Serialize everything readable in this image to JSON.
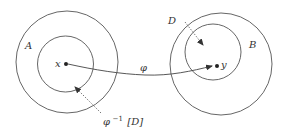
{
  "diagram": {
    "colors": {
      "stroke": "#555555",
      "text": "#333333",
      "background": "#ffffff"
    },
    "sets": [
      {
        "id": "A",
        "label": "A",
        "outer": {
          "cx": 67,
          "cy": 62,
          "r": 51
        },
        "inner": {
          "cx": 65.5,
          "cy": 64,
          "r": 28
        }
      },
      {
        "id": "B",
        "label": "B",
        "outer": {
          "cx": 221,
          "cy": 64,
          "r": 51
        },
        "inner": {
          "cx": 213,
          "cy": 52,
          "r": 28
        }
      }
    ],
    "points": {
      "x": {
        "label": "x",
        "cx": 66,
        "cy": 64
      },
      "y": {
        "label": "y",
        "cx": 217,
        "cy": 66
      }
    },
    "mapping": {
      "label": "φ",
      "style": "solid-arrow"
    },
    "subset_labels": {
      "D": {
        "label": "D",
        "style": "dotted-arrow"
      },
      "preimage": {
        "symbol": "φ",
        "superscript": "−1",
        "bracket_text": "[D]",
        "style": "dotted-arrow"
      }
    }
  }
}
